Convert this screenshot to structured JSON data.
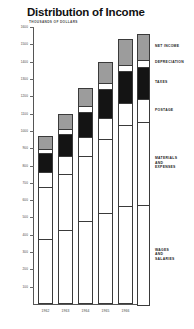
{
  "chart_data": {
    "type": "bar",
    "title": "Distribution of Income",
    "subtitle": "THOUSANDS OF DOLLARS",
    "xlabel": "",
    "ylabel": "THOUSANDS OF DOLLARS",
    "ylim": [
      0,
      1600
    ],
    "grid": false,
    "stacked": true,
    "legend_position": "right",
    "categories": [
      "1962",
      "1963",
      "1964",
      "1965",
      "1966"
    ],
    "ytick_labels": [
      "1600",
      "1500",
      "1400",
      "1300",
      "1200",
      "1100",
      "1000",
      "900",
      "800",
      "700",
      "600",
      "500",
      "400",
      "300",
      "200",
      "100"
    ],
    "ytick_values": [
      1600,
      1500,
      1400,
      1300,
      1200,
      1100,
      1000,
      900,
      800,
      700,
      600,
      500,
      400,
      300,
      200,
      100
    ],
    "series": [
      {
        "name": "WAGES AND SALARIES",
        "color": "#ffffff",
        "values": [
          370,
          420,
          470,
          520,
          560
        ]
      },
      {
        "name": "MATERIALS AND EXPENSES",
        "color": "#ffffff",
        "values": [
          300,
          330,
          380,
          430,
          470
        ]
      },
      {
        "name": "POSTAGE",
        "color": "#ffffff",
        "values": [
          90,
          100,
          110,
          120,
          130
        ]
      },
      {
        "name": "TAXES",
        "color": "#141414",
        "values": [
          110,
          130,
          150,
          170,
          185
        ]
      },
      {
        "name": "DEPRECIATION",
        "color": "#ffffff",
        "values": [
          25,
          28,
          30,
          33,
          36
        ]
      },
      {
        "name": "NET INCOME",
        "color": "#9c9c9c",
        "values": [
          75,
          92,
          110,
          127,
          149
        ]
      }
    ],
    "totals": [
      970,
      1100,
      1250,
      1400,
      1530
    ],
    "colors": {
      "net_income": "#9c9c9c",
      "depreciation": "#ffffff",
      "taxes": "#141414",
      "postage": "#ffffff",
      "materials": "#ffffff",
      "wages": "#ffffff",
      "outline": "#3a3a3a",
      "axis": "#555555",
      "text": "#1a1a1a",
      "background": "#ffffff"
    }
  },
  "legend": {
    "items": [
      {
        "label": "NET INCOME"
      },
      {
        "label": "DEPRECIATION"
      },
      {
        "label": "TAXES"
      },
      {
        "label": "POSTAGE"
      },
      {
        "label": "MATERIALS\nAND\nEXPENSES"
      },
      {
        "label": "WAGES\nAND\nSALARIES"
      }
    ]
  }
}
